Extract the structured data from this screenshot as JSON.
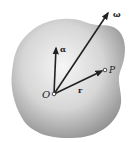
{
  "diagram": {
    "labels": {
      "origin": "O",
      "point": "P",
      "position_vector": "r",
      "angular_velocity": "ω",
      "angular_acceleration": "α"
    },
    "colors": {
      "body_light": "#f4f4f4",
      "body_dark": "#9a9a9a",
      "vector": "#222222"
    }
  }
}
